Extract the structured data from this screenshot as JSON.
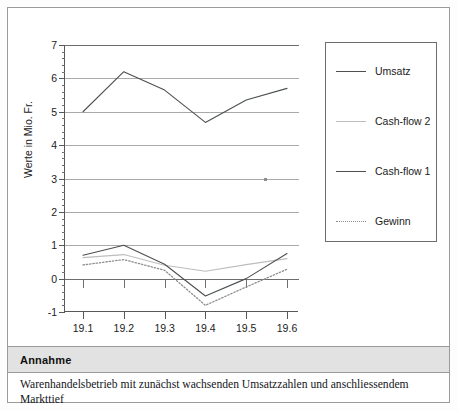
{
  "chart_data": {
    "type": "line",
    "title": "",
    "xlabel": "",
    "ylabel": "Werte in Mio. Fr.",
    "categories": [
      "19.1",
      "19.2",
      "19.3",
      "19.4",
      "19.5",
      "19.6"
    ],
    "ylim": [
      -1,
      7
    ],
    "yticks": [
      -1,
      0,
      1,
      2,
      3,
      4,
      5,
      6,
      7
    ],
    "ytick_labels": [
      "-1",
      "0",
      "1",
      "2",
      "3",
      "4",
      "5",
      "6",
      "7"
    ],
    "y_minor_step": 0.2,
    "grid": true,
    "legend_position": "right",
    "series": [
      {
        "name": "Umsatz",
        "values": [
          5.0,
          6.2,
          5.65,
          4.68,
          5.35,
          5.7
        ],
        "color": "#4c5053",
        "style": "solid",
        "width": 1.1
      },
      {
        "name": "Cash-flow 2",
        "values": [
          0.63,
          0.72,
          0.4,
          0.22,
          0.42,
          0.6
        ],
        "color": "#bdbdbd",
        "style": "solid",
        "width": 1.1
      },
      {
        "name": "Cash-flow 1",
        "values": [
          0.7,
          1.0,
          0.43,
          -0.52,
          0.0,
          0.75
        ],
        "color": "#4c5053",
        "style": "solid",
        "width": 1.1
      },
      {
        "name": "Gewinn",
        "values": [
          0.41,
          0.57,
          0.25,
          -0.8,
          -0.25,
          0.28
        ],
        "color": "#8e8e8e",
        "style": "dotted",
        "width": 1.3
      }
    ]
  },
  "legend": {
    "entries": [
      {
        "label": "Umsatz"
      },
      {
        "label": "Cash-flow 2"
      },
      {
        "label": "Cash-flow 1"
      },
      {
        "label": "Gewinn"
      }
    ]
  },
  "footer": {
    "title": "Annahme",
    "text": "Warenhandelsbetrieb mit zunächst wachsenden Umsatzzahlen und anschliessendem Markttief"
  }
}
